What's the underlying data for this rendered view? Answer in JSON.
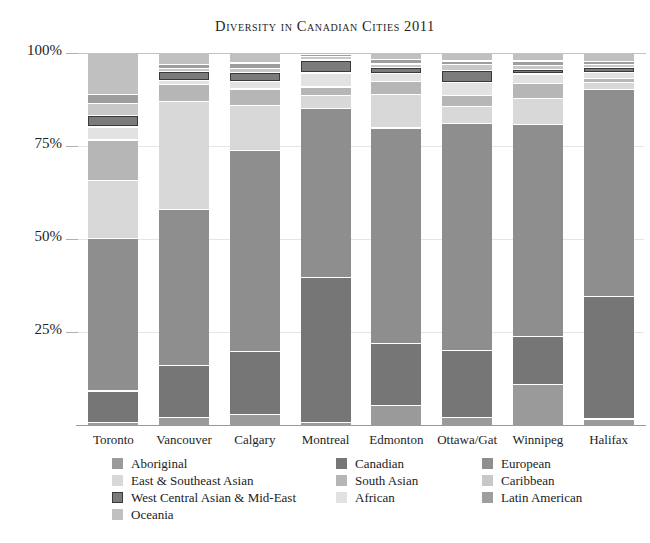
{
  "chart_data": {
    "type": "bar",
    "subtype": "stacked-percent",
    "title": "Diversity in Canadian Cities 2011",
    "xlabel": "",
    "ylabel": "",
    "ylim": [
      0,
      100
    ],
    "ytick_labels": [
      "100%",
      "75%",
      "50%",
      "25%"
    ],
    "ytick_values": [
      100,
      75,
      50,
      25
    ],
    "grid": true,
    "legend_position": "bottom",
    "categories": [
      "Toronto",
      "Vancouver",
      "Calgary",
      "Montreal",
      "Edmonton",
      "Ottawa/Gat",
      "Winnipeg",
      "Halifax"
    ],
    "series": [
      {
        "name": "Aboriginal",
        "color": "#9a9a9a",
        "outlined": false,
        "values": [
          0.8,
          2.2,
          3.0,
          0.8,
          5.5,
          2.2,
          11.0,
          1.8
        ]
      },
      {
        "name": "Canadian",
        "color": "#767676",
        "outlined": false,
        "values": [
          8.5,
          14.0,
          17.0,
          39.0,
          16.5,
          18.0,
          13.0,
          33.0
        ]
      },
      {
        "name": "European",
        "color": "#8e8e8e",
        "outlined": false,
        "values": [
          41.0,
          42.0,
          54.0,
          45.5,
          58.0,
          61.0,
          57.0,
          55.5
        ]
      },
      {
        "name": "East & Southeast Asian",
        "color": "#d8d8d8",
        "outlined": false,
        "values": [
          15.5,
          29.0,
          12.0,
          3.5,
          9.0,
          4.5,
          7.0,
          2.0
        ]
      },
      {
        "name": "South Asian",
        "color": "#b6b6b6",
        "outlined": false,
        "values": [
          11.0,
          4.5,
          4.5,
          2.2,
          3.5,
          3.0,
          4.0,
          1.0
        ]
      },
      {
        "name": "African",
        "color": "#e2e2e2",
        "outlined": false,
        "values": [
          3.5,
          1.0,
          2.0,
          3.8,
          2.2,
          3.5,
          2.5,
          1.6
        ]
      },
      {
        "name": "West Central Asian & Mid-East",
        "color": "#7b7b7b",
        "outlined": true,
        "values": [
          3.0,
          2.5,
          2.5,
          3.5,
          1.6,
          3.2,
          1.3,
          1.4
        ]
      },
      {
        "name": "Caribbean",
        "color": "#c8c8c8",
        "outlined": false,
        "values": [
          3.2,
          0.8,
          1.0,
          1.0,
          0.9,
          1.6,
          0.9,
          0.8
        ]
      },
      {
        "name": "Latin American",
        "color": "#9e9e9e",
        "outlined": false,
        "values": [
          2.5,
          1.0,
          1.5,
          0.5,
          1.3,
          1.0,
          1.3,
          0.8
        ]
      },
      {
        "name": "Oceania",
        "color": "#c0c0c0",
        "outlined": false,
        "values": [
          11.0,
          3.0,
          2.5,
          0.2,
          1.5,
          2.0,
          2.0,
          2.1
        ]
      }
    ]
  },
  "legend": {
    "columns": [
      {
        "items": [
          {
            "label": "Aboriginal",
            "color": "#9a9a9a",
            "outlined": false
          },
          {
            "label": "East & Southeast Asian",
            "color": "#d8d8d8",
            "outlined": false
          },
          {
            "label": "West Central Asian & Mid-East",
            "color": "#7b7b7b",
            "outlined": true
          },
          {
            "label": "Oceania",
            "color": "#c0c0c0",
            "outlined": false
          }
        ]
      },
      {
        "items": [
          {
            "label": "Canadian",
            "color": "#767676",
            "outlined": false
          },
          {
            "label": "South Asian",
            "color": "#b6b6b6",
            "outlined": false
          },
          {
            "label": "African",
            "color": "#e2e2e2",
            "outlined": false
          }
        ]
      },
      {
        "items": [
          {
            "label": "European",
            "color": "#8e8e8e",
            "outlined": false
          },
          {
            "label": "Caribbean",
            "color": "#c8c8c8",
            "outlined": false
          },
          {
            "label": "Latin American",
            "color": "#9e9e9e",
            "outlined": false
          }
        ]
      }
    ]
  }
}
